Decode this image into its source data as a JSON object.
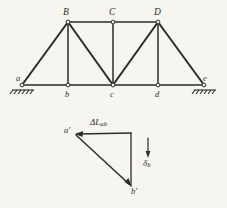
{
  "figure": {
    "background_color": "#f7f5f0",
    "line_color": "#2b2b2b",
    "width": 227,
    "height": 208
  },
  "truss": {
    "upper_joint_labels": [
      "B",
      "C",
      "D"
    ],
    "lower_joint_labels": [
      "a",
      "b",
      "c",
      "d",
      "e"
    ],
    "upper_joints": [
      {
        "label": "B",
        "x": 68,
        "y": 22
      },
      {
        "label": "C",
        "x": 113,
        "y": 22
      },
      {
        "label": "D",
        "x": 158,
        "y": 22
      }
    ],
    "lower_joints": [
      {
        "label": "a",
        "x": 22,
        "y": 85
      },
      {
        "label": "b",
        "x": 68,
        "y": 85
      },
      {
        "label": "c",
        "x": 113,
        "y": 85
      },
      {
        "label": "d",
        "x": 158,
        "y": 85
      },
      {
        "label": "e",
        "x": 204,
        "y": 85
      }
    ],
    "members": [
      {
        "name": "top-chord-B-C",
        "x1": 68,
        "y1": 22,
        "x2": 113,
        "y2": 22
      },
      {
        "name": "top-chord-C-D",
        "x1": 113,
        "y1": 22,
        "x2": 158,
        "y2": 22
      },
      {
        "name": "bottom-chord-a-b",
        "x1": 22,
        "y1": 85,
        "x2": 68,
        "y2": 85
      },
      {
        "name": "bottom-chord-b-c",
        "x1": 68,
        "y1": 85,
        "x2": 113,
        "y2": 85
      },
      {
        "name": "bottom-chord-c-d",
        "x1": 113,
        "y1": 85,
        "x2": 158,
        "y2": 85
      },
      {
        "name": "bottom-chord-d-e",
        "x1": 158,
        "y1": 85,
        "x2": 204,
        "y2": 85
      },
      {
        "name": "diagonal-a-B",
        "x1": 22,
        "y1": 85,
        "x2": 68,
        "y2": 22
      },
      {
        "name": "diagonal-B-c",
        "x1": 68,
        "y1": 22,
        "x2": 113,
        "y2": 85
      },
      {
        "name": "diagonal-c-D",
        "x1": 113,
        "y1": 85,
        "x2": 158,
        "y2": 22
      },
      {
        "name": "diagonal-D-e",
        "x1": 158,
        "y1": 22,
        "x2": 204,
        "y2": 85
      },
      {
        "name": "vertical-B-b",
        "x1": 68,
        "y1": 22,
        "x2": 68,
        "y2": 85
      },
      {
        "name": "vertical-C-c",
        "x1": 113,
        "y1": 22,
        "x2": 113,
        "y2": 85
      },
      {
        "name": "vertical-D-d",
        "x1": 158,
        "y1": 22,
        "x2": 158,
        "y2": 85
      }
    ],
    "supports": [
      {
        "name": "support-left",
        "at_joint": "a",
        "x": 22,
        "y": 85,
        "type": "hatched-ground"
      },
      {
        "name": "support-right",
        "at_joint": "e",
        "x": 204,
        "y": 85,
        "type": "hatched-ground"
      }
    ]
  },
  "displacement_diagram": {
    "vertices": [
      {
        "label": "a'",
        "x": 75,
        "y": 134
      },
      {
        "label": "corner",
        "x": 131,
        "y": 133
      },
      {
        "label": "b'",
        "x": 131,
        "y": 186
      }
    ],
    "vectors": [
      {
        "name": "elongation-vector",
        "label": "ΔL",
        "label_subscript": "ab",
        "from": {
          "x": 131,
          "y": 133
        },
        "to": {
          "x": 75,
          "y": 134
        },
        "arrow_at": "to"
      },
      {
        "name": "resultant-vector",
        "from": {
          "x": 75,
          "y": 134
        },
        "to": {
          "x": 131,
          "y": 186
        },
        "arrow_at": "to"
      },
      {
        "name": "vertical-leg",
        "from": {
          "x": 131,
          "y": 133
        },
        "to": {
          "x": 131,
          "y": 186
        },
        "arrow_at": "none"
      },
      {
        "name": "settlement-vector",
        "label": "δ",
        "label_subscript": "b",
        "from": {
          "x": 148,
          "y": 140
        },
        "to": {
          "x": 148,
          "y": 157
        },
        "arrow_at": "to"
      }
    ],
    "labels": {
      "delta_l_ab": "ΔL",
      "delta_l_ab_sub": "ab",
      "delta_b": "δ",
      "delta_b_sub": "b",
      "a_prime": "a'",
      "b_prime": "b'"
    }
  }
}
